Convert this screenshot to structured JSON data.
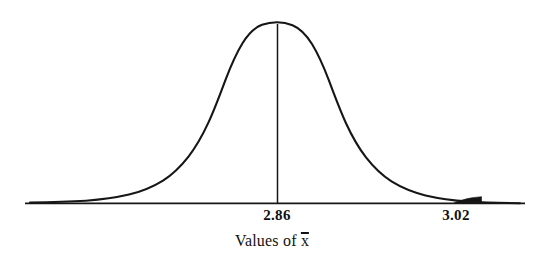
{
  "figure": {
    "caption_prefix": "Values of ",
    "caption_variable": "x",
    "caption_full": "Values of x̄"
  },
  "axis": {
    "mean_label": "2.86",
    "upper_label": "3.02",
    "line_color": "#111111"
  },
  "chart_data": {
    "type": "line",
    "subtype": "normal-distribution-density-curve",
    "title": "",
    "subtitle": "",
    "xlabel": "Values of x̄",
    "ylabel": "",
    "grid": false,
    "legend": null,
    "axis_ticks": [
      {
        "label": "2.86",
        "value": 2.86,
        "x_px": 277,
        "role": "mean"
      },
      {
        "label": "3.02",
        "value": 3.02,
        "x_px": 456,
        "role": "critical-value"
      }
    ],
    "distribution": {
      "mean": 2.86,
      "critical_value": 3.02,
      "mean_x_px": 277,
      "critical_x_px": 456,
      "sigma_px": 85,
      "peak_y_px": 24,
      "baseline_y_px": 203,
      "peak_height_px": 179
    },
    "annotations": [
      {
        "kind": "vertical-line",
        "at_label": "2.86",
        "from_y_px": 24,
        "to_y_px": 203,
        "x_px": 277
      },
      {
        "kind": "shaded-tail",
        "side": "right",
        "from_label": "3.02",
        "from_x_px": 454,
        "to_x_px": 481,
        "fill": "#111111"
      }
    ],
    "x": [
      25,
      45,
      65,
      85,
      105,
      125,
      145,
      165,
      185,
      205,
      225,
      245,
      265,
      277,
      290,
      310,
      330,
      350,
      370,
      390,
      410,
      430,
      450,
      456,
      470,
      490,
      510,
      525
    ],
    "values": [
      0.0,
      0.001,
      0.004,
      0.012,
      0.032,
      0.074,
      0.148,
      0.263,
      0.41,
      0.579,
      0.746,
      0.887,
      0.981,
      1.0,
      0.989,
      0.911,
      0.785,
      0.629,
      0.468,
      0.322,
      0.205,
      0.121,
      0.066,
      0.056,
      0.033,
      0.015,
      0.006,
      0.003
    ],
    "ylim": [
      0,
      1.05
    ],
    "xlim_px": [
      25,
      525
    ]
  }
}
